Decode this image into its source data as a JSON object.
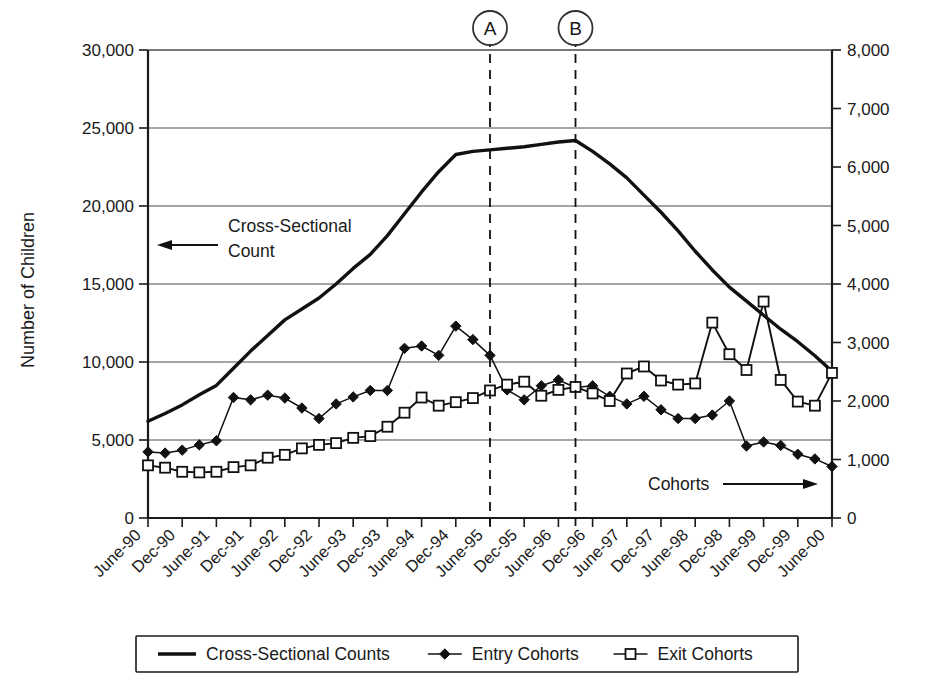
{
  "chart_data": {
    "type": "line",
    "title": "",
    "xlabel": "",
    "ylabel": "Number of Children",
    "ylabel_right": "",
    "ylim": [
      0,
      30000
    ],
    "ylim_right": [
      0,
      8000
    ],
    "y_ticks": [
      "0",
      "5,000",
      "10,000",
      "15,000",
      "20,000",
      "25,000",
      "30,000"
    ],
    "y_tick_values": [
      0,
      5000,
      10000,
      15000,
      20000,
      25000,
      30000
    ],
    "y_ticks_right": [
      "0",
      "1,000",
      "2,000",
      "3,000",
      "4,000",
      "5,000",
      "6,000",
      "7,000",
      "8,000"
    ],
    "y_tick_values_right": [
      0,
      1000,
      2000,
      3000,
      4000,
      5000,
      6000,
      7000,
      8000
    ],
    "grid": true,
    "grid_axis": "y",
    "legend_position": "bottom",
    "x_tick_labels": [
      "June-90",
      "Dec-90",
      "June-91",
      "Dec-91",
      "June-92",
      "Dec-92",
      "June-93",
      "Dec-93",
      "June-94",
      "Dec-94",
      "June-95",
      "Dec-95",
      "June-96",
      "Dec-96",
      "June-97",
      "Dec-97",
      "June-98",
      "Dec-98",
      "June-99",
      "Dec-99",
      "June-00"
    ],
    "x_quarters": [
      "June-90",
      "Sept-90",
      "Dec-90",
      "Mar-91",
      "June-91",
      "Sept-91",
      "Dec-91",
      "Mar-92",
      "June-92",
      "Sept-92",
      "Dec-92",
      "Mar-93",
      "June-93",
      "Sept-93",
      "Dec-93",
      "Mar-94",
      "June-94",
      "Sept-94",
      "Dec-94",
      "Mar-95",
      "June-95",
      "Sept-95",
      "Dec-95",
      "Mar-96",
      "June-96",
      "Sept-96",
      "Dec-96",
      "Mar-97",
      "June-97",
      "Sept-97",
      "Dec-97",
      "Mar-98",
      "June-98",
      "Sept-98",
      "Dec-98",
      "Mar-99",
      "June-99",
      "Sept-99",
      "Dec-99",
      "Mar-00",
      "June-00"
    ],
    "series": [
      {
        "name": "Cross-Sectional Counts",
        "axis": "left",
        "marker": "none",
        "values": [
          6200,
          6700,
          7250,
          7900,
          8500,
          9600,
          10700,
          11700,
          12700,
          13400,
          14100,
          15000,
          16000,
          16900,
          18100,
          19500,
          20900,
          22200,
          23300,
          23500,
          23600,
          23700,
          23800,
          23950,
          24100,
          24200,
          23500,
          22700,
          21800,
          20700,
          19600,
          18400,
          17100,
          15900,
          14800,
          13900,
          13000,
          12100,
          11300,
          10400,
          9400
        ]
      },
      {
        "name": "Entry Cohorts",
        "axis": "right",
        "marker": "filled-diamond",
        "values": [
          1130,
          1110,
          1160,
          1250,
          1320,
          2060,
          2020,
          2100,
          2050,
          1880,
          1700,
          1950,
          2070,
          2180,
          2180,
          2900,
          2940,
          2780,
          3280,
          3050,
          2780,
          2190,
          2020,
          2260,
          2360,
          2230,
          2260,
          2080,
          1950,
          2080,
          1850,
          1700,
          1700,
          1760,
          2000,
          1230,
          1300,
          1240,
          1090,
          1010,
          880
        ]
      },
      {
        "name": "Exit Cohorts",
        "axis": "right",
        "marker": "open-square",
        "values": [
          900,
          860,
          790,
          780,
          790,
          870,
          900,
          1030,
          1080,
          1190,
          1250,
          1280,
          1370,
          1400,
          1560,
          1800,
          2060,
          1920,
          1980,
          2050,
          2180,
          2280,
          2330,
          2090,
          2190,
          2240,
          2130,
          2000,
          2470,
          2590,
          2350,
          2280,
          2300,
          3340,
          2800,
          2530,
          3700,
          2360,
          1990,
          1920,
          2480
        ]
      }
    ],
    "vertical_markers": [
      {
        "label": "A",
        "x_position": "June-95"
      },
      {
        "label": "B",
        "x_position": "Sept-96"
      }
    ],
    "annotations": [
      {
        "text_line1": "Cross-Sectional",
        "text_line2": "Count",
        "arrow_direction": "left"
      },
      {
        "text_line1": "Cohorts",
        "text_line2": "",
        "arrow_direction": "right"
      }
    ],
    "legend": [
      {
        "label": "Cross-Sectional Counts",
        "marker": "line"
      },
      {
        "label": "Entry Cohorts",
        "marker": "filled-diamond"
      },
      {
        "label": "Exit Cohorts",
        "marker": "open-square"
      }
    ],
    "colors": {
      "line": "#111111",
      "grid": "#4d4d4d",
      "axis": "#1a1a1a",
      "background": "#ffffff"
    }
  }
}
